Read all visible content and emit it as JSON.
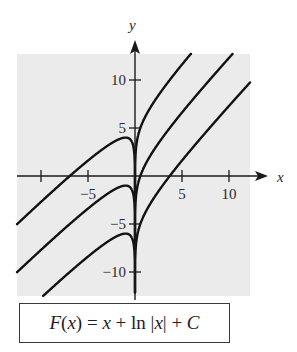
{
  "chart_data": {
    "type": "line",
    "title": "",
    "xlabel": "x",
    "ylabel": "y",
    "xlim": [
      -12.5,
      12.3
    ],
    "ylim": [
      -12.5,
      12.7
    ],
    "x_ticks": [
      -10,
      -5,
      5,
      10
    ],
    "x_tick_labels": [
      "",
      "-5",
      "5",
      "10"
    ],
    "y_ticks": [
      -10,
      -5,
      5,
      10
    ],
    "y_tick_labels": [
      "-10",
      "-5",
      "5",
      "10"
    ],
    "grid": false,
    "background": "#ebebeb",
    "function": "F(x) = x + ln|x| + C",
    "series": [
      {
        "name": "C = 5",
        "C": 5
      },
      {
        "name": "C = 0",
        "C": 0
      },
      {
        "name": "C = -5",
        "C": -5
      }
    ],
    "annotations": [
      "F(x) = x + ln |x| + C"
    ]
  },
  "labels": {
    "x_axis": "x",
    "y_axis": "y",
    "formula": {
      "lhs": "F",
      "paren_open": "(",
      "arg": "x",
      "paren_close": ")",
      "eq": " = ",
      "t1": "x",
      "plus1": " + ",
      "ln": "ln ",
      "abs_open": "|",
      "abs_arg": "x",
      "abs_close": "|",
      "plus2": " + ",
      "c": "C"
    }
  },
  "colors": {
    "panel": "#ebebeb",
    "curve": "#111111",
    "axis": "#1a1a1a"
  }
}
